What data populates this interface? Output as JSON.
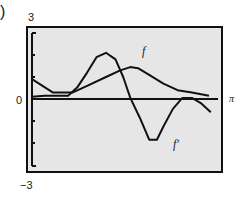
{
  "figure": {
    "panel_marker": ")",
    "y_max_label": "3",
    "y_zero_label": "0",
    "y_min_label": "−3",
    "x_max_label": "π",
    "curve_labels": {
      "f": "f",
      "fprime": "f′"
    }
  },
  "colors": {
    "background": "#ffffff",
    "plot_bg": "#e6e6e6",
    "line": "#111111"
  },
  "chart_data": {
    "type": "line",
    "title": "",
    "xlabel": "",
    "ylabel": "",
    "xlim": [
      0,
      3.1416
    ],
    "ylim": [
      -3,
      3
    ],
    "x_tick_labels": [
      "π"
    ],
    "y_tick_labels": [
      "3",
      "0",
      "−3"
    ],
    "grid": false,
    "legend": "inline labels",
    "series": [
      {
        "name": "f",
        "x": [
          0.0,
          0.35,
          0.69,
          0.93,
          1.25,
          1.49,
          1.66,
          1.79,
          1.98,
          2.22,
          2.46,
          2.7,
          2.99
        ],
        "y": [
          0.9,
          0.3,
          0.3,
          0.6,
          1.0,
          1.3,
          1.45,
          1.4,
          1.1,
          0.7,
          0.4,
          0.3,
          0.15
        ]
      },
      {
        "name": "f′",
        "x": [
          0.0,
          0.21,
          0.37,
          0.61,
          0.77,
          0.93,
          1.09,
          1.25,
          1.41,
          1.54,
          1.66,
          1.82,
          1.98,
          2.11,
          2.22,
          2.38,
          2.54,
          2.7,
          2.86,
          3.02
        ],
        "y": [
          0.1,
          0.15,
          0.15,
          0.15,
          0.55,
          1.2,
          1.9,
          2.1,
          1.8,
          1.0,
          0.05,
          -0.85,
          -1.85,
          -1.85,
          -1.25,
          -0.45,
          0.05,
          0.05,
          -0.2,
          -0.6
        ]
      }
    ]
  }
}
